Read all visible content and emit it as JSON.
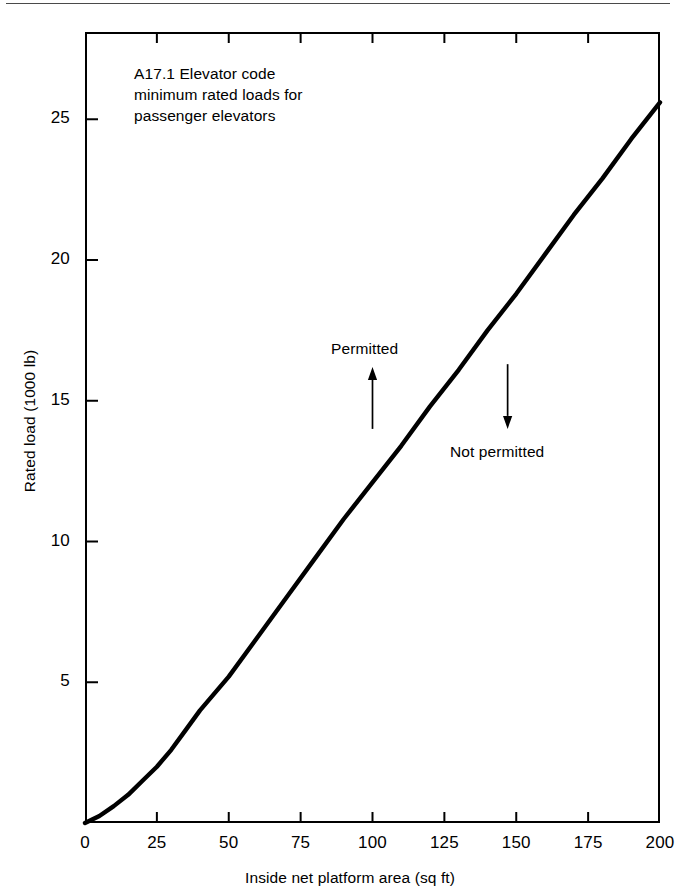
{
  "chart_data": {
    "type": "line",
    "title": "",
    "annotation_note": "A17.1 Elevator code\nminimum rated loads for\npassenger elevators",
    "xlabel": "Inside net platform area (sq ft)",
    "ylabel": "Rated load (1000 lb)",
    "xlim": [
      0,
      200
    ],
    "ylim": [
      0,
      28.1
    ],
    "grid": false,
    "legend": null,
    "xticks": [
      "0",
      "25",
      "50",
      "75",
      "100",
      "125",
      "150",
      "175",
      "200"
    ],
    "xtick_values": [
      0,
      25,
      50,
      75,
      100,
      125,
      150,
      175,
      200
    ],
    "yticks": [
      "5",
      "10",
      "15",
      "20",
      "25"
    ],
    "ytick_values": [
      5,
      10,
      15,
      20,
      25
    ],
    "series": [
      {
        "name": "A17.1 minimum rated load",
        "x": [
          0,
          5,
          10,
          15,
          20,
          25,
          30,
          35,
          40,
          50,
          60,
          70,
          80,
          90,
          100,
          110,
          120,
          130,
          140,
          150,
          160,
          170,
          180,
          190,
          200
        ],
        "y": [
          0.0,
          0.25,
          0.6,
          1.0,
          1.5,
          2.0,
          2.6,
          3.3,
          4.0,
          5.2,
          6.6,
          8.0,
          9.4,
          10.8,
          12.1,
          13.4,
          14.8,
          16.1,
          17.5,
          18.8,
          20.2,
          21.6,
          22.9,
          24.3,
          25.6
        ]
      }
    ],
    "annotations": [
      {
        "name": "permitted",
        "text": "Permitted",
        "arrow": "up",
        "x_value": 100,
        "y_from": 14.0,
        "y_to": 16.2
      },
      {
        "name": "not-permitted",
        "text": "Not permitted",
        "arrow": "down",
        "x_value": 147,
        "y_from": 16.3,
        "y_to": 14.0
      }
    ],
    "colors": {
      "curve": "#000000",
      "axis": "#000000",
      "background": "#ffffff",
      "rule": "#4a4a4a"
    }
  }
}
